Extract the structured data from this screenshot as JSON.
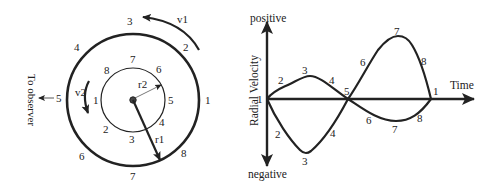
{
  "orbit_diagram": {
    "outer_orbit": {
      "positions": [
        "1",
        "2",
        "3",
        "4",
        "5",
        "6",
        "7",
        "8"
      ],
      "radius_label": "r1",
      "velocity_label": "v1"
    },
    "inner_orbit": {
      "positions": [
        "1",
        "2",
        "3",
        "4",
        "5",
        "6",
        "7",
        "8"
      ],
      "radius_label": "r2",
      "velocity_label": "v2"
    },
    "observer_label": "To observer"
  },
  "velocity_plot": {
    "y_axis_label": "Radial Velocity",
    "y_positive_label": "positive",
    "y_negative_label": "negative",
    "x_axis_label": "Time",
    "origin_label": "1",
    "upper_curve_labels": [
      "2",
      "3",
      "4",
      "5",
      "6",
      "7",
      "8",
      "1"
    ],
    "lower_curve_labels": [
      "2",
      "3",
      "4",
      "6",
      "7",
      "8"
    ]
  },
  "colors": {
    "stroke": "#222222",
    "background": "#ffffff"
  }
}
